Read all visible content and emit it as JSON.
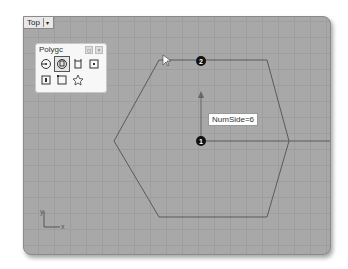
{
  "viewport": {
    "name": "Top",
    "menu_arrow": "▾"
  },
  "palette": {
    "title": "Polygc",
    "title_buttons": [
      "◻",
      "×"
    ],
    "tools": [
      {
        "icon": "polygon-center-icon"
      },
      {
        "icon": "polygon-edge-center-icon",
        "selected": true
      },
      {
        "icon": "polygon-circumscribed-icon"
      },
      {
        "icon": "rectangle-center-icon"
      },
      {
        "icon": "polygon-edge-icon"
      },
      {
        "icon": "rectangle-corner-icon"
      },
      {
        "icon": "star-polygon-icon"
      }
    ]
  },
  "drawing": {
    "shape": "hexagon",
    "center_marker": "1",
    "vertex_marker": "2",
    "tooltip": "NumSide=6"
  },
  "axes": {
    "x_label": "x",
    "y_label": "y"
  },
  "colors": {
    "viewport_bg": "#a8a8a8",
    "grid_line": "#9e9e9e",
    "curve": "#5a5a5a",
    "marker": "#111111"
  }
}
